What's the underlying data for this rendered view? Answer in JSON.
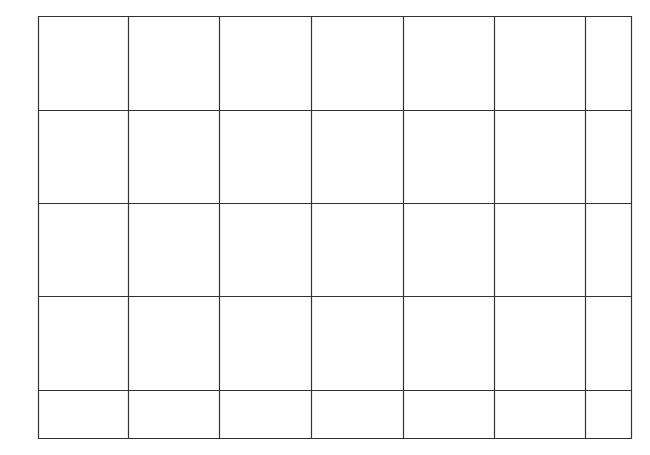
{
  "grid": {
    "line_color": "#333333",
    "background": "#ffffff",
    "columns_x": [
      38,
      128,
      219,
      311,
      403,
      494,
      585,
      631
    ],
    "rows_y": [
      16,
      110,
      203,
      296,
      390,
      438
    ],
    "column_count": 7,
    "row_count": 5
  }
}
